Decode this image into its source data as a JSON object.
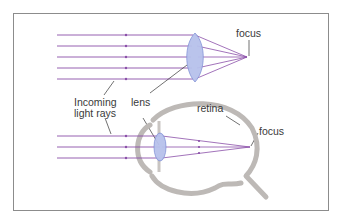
{
  "diagram": {
    "labels": {
      "focus_top": "focus",
      "lens": "lens",
      "incoming_line1": "Incoming",
      "incoming_line2": "light rays",
      "retina": "retina",
      "focus_bottom": "focus"
    },
    "colors": {
      "ray": "#8a4fa8",
      "lens_fill": "#b7c1ec",
      "lens_stroke": "#7f8fd6",
      "eye_wall": "#bdb9b6",
      "leader_line": "#333333",
      "frame_border": "#8c8c8c"
    },
    "top_lens_system": {
      "ray_y": [
        35,
        46,
        57,
        68,
        79
      ],
      "ray_start_x": 57,
      "lens_center": [
        195,
        57
      ],
      "focus_point": [
        247,
        57
      ]
    },
    "eye_system": {
      "ray_y": [
        136,
        147,
        158
      ],
      "ray_start_x": 57,
      "lens_center": [
        160,
        147
      ],
      "focus_point": [
        250,
        147
      ]
    }
  }
}
